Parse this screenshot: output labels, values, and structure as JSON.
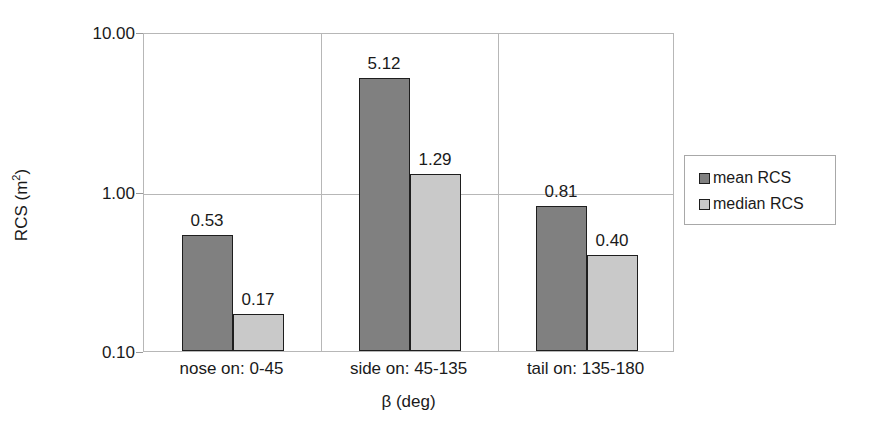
{
  "chart_data": {
    "type": "bar",
    "title": "",
    "xlabel": "β (deg)",
    "ylabel": "RCS (m²)",
    "ylabel_base": "RCS (m",
    "ylabel_sup": "2",
    "ylabel_tail": ")",
    "yscale": "log",
    "ylim": [
      0.1,
      10.0
    ],
    "ytick_labels": [
      "10.00",
      "1.00",
      "0.10"
    ],
    "ytick_values": [
      10.0,
      1.0,
      0.1
    ],
    "grid": "horizontal-and-category-dividers",
    "legend_position": "right",
    "categories": [
      "nose on:  0-45",
      "side on: 45-135",
      "tail on: 135-180"
    ],
    "series": [
      {
        "name": "mean RCS",
        "color": "#808080",
        "values": [
          0.53,
          5.12,
          0.81
        ],
        "labels": [
          "0.53",
          "5.12",
          "0.81"
        ]
      },
      {
        "name": "median RCS",
        "color": "#c9c9c9",
        "values": [
          0.17,
          1.29,
          0.4
        ],
        "labels": [
          "0.17",
          "1.29",
          "0.40"
        ]
      }
    ]
  },
  "legend": {
    "entries": [
      {
        "label": "mean RCS",
        "swatch": "mean"
      },
      {
        "label": "median RCS",
        "swatch": "median"
      }
    ]
  },
  "colors": {
    "mean_bar": "#808080",
    "median_bar": "#c9c9c9",
    "bar_outline": "#1e1e1e",
    "gridline": "#b7b7b7",
    "text": "#1a1a1a",
    "background": "#ffffff"
  }
}
